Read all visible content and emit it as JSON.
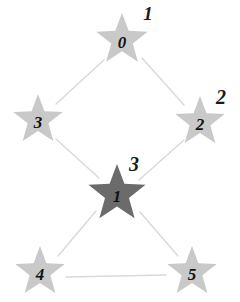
{
  "diagram": {
    "type": "star-node-graph",
    "background_color": "#ffffff",
    "edge_color": "#d9d9d9",
    "default_node_color": "#c9c9c9",
    "highlight_node_color": "#6b6b6b",
    "nodes": [
      {
        "id": "node-0",
        "inner_label": "0",
        "outer_label": "1",
        "x": 122,
        "y": 40,
        "radius": 27,
        "color": "#c9c9c9",
        "label_x": 148,
        "label_y": 16,
        "label_size": 19,
        "inner_size": 17,
        "highlighted": false
      },
      {
        "id": "node-3",
        "inner_label": "3",
        "outer_label": "",
        "x": 38,
        "y": 120,
        "radius": 26,
        "color": "#c9c9c9",
        "label_x": 0,
        "label_y": 0,
        "label_size": 0,
        "inner_size": 17,
        "highlighted": false
      },
      {
        "id": "node-2",
        "inner_label": "2",
        "outer_label": "2",
        "x": 200,
        "y": 122,
        "radius": 26,
        "color": "#c9c9c9",
        "label_x": 221,
        "label_y": 99,
        "label_size": 20,
        "inner_size": 17,
        "highlighted": false
      },
      {
        "id": "node-1",
        "inner_label": "1",
        "outer_label": "3",
        "x": 117,
        "y": 194,
        "radius": 30,
        "color": "#6b6b6b",
        "label_x": 134,
        "label_y": 166,
        "label_size": 20,
        "inner_size": 17,
        "highlighted": true
      },
      {
        "id": "node-4",
        "inner_label": "4",
        "outer_label": "",
        "x": 40,
        "y": 272,
        "radius": 26,
        "color": "#c9c9c9",
        "label_x": 0,
        "label_y": 0,
        "label_size": 0,
        "inner_size": 17,
        "highlighted": false
      },
      {
        "id": "node-5",
        "inner_label": "5",
        "outer_label": "",
        "x": 192,
        "y": 272,
        "radius": 26,
        "color": "#c9c9c9",
        "label_x": 0,
        "label_y": 0,
        "label_size": 0,
        "inner_size": 17,
        "highlighted": false
      }
    ],
    "edges": [
      {
        "id": "edge-0-3",
        "from": "node-0",
        "to": "node-3",
        "x1": 104,
        "y1": 60,
        "x2": 56,
        "y2": 104
      },
      {
        "id": "edge-0-2",
        "from": "node-0",
        "to": "node-2",
        "x1": 142,
        "y1": 58,
        "x2": 184,
        "y2": 105
      },
      {
        "id": "edge-3-1",
        "from": "node-3",
        "to": "node-1",
        "x1": 56,
        "y1": 139,
        "x2": 99,
        "y2": 178
      },
      {
        "id": "edge-2-1",
        "from": "node-2",
        "to": "node-1",
        "x1": 184,
        "y1": 140,
        "x2": 139,
        "y2": 180
      },
      {
        "id": "edge-1-4",
        "from": "node-1",
        "to": "node-4",
        "x1": 96,
        "y1": 211,
        "x2": 58,
        "y2": 256
      },
      {
        "id": "edge-1-5",
        "from": "node-1",
        "to": "node-5",
        "x1": 140,
        "y1": 212,
        "x2": 178,
        "y2": 256
      },
      {
        "id": "edge-4-5",
        "from": "node-4",
        "to": "node-5",
        "x1": 66,
        "y1": 277,
        "x2": 166,
        "y2": 275
      }
    ]
  }
}
